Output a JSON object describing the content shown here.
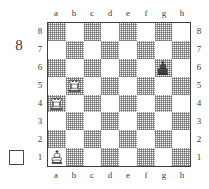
{
  "diagram": {
    "number": "8",
    "side_to_move_marker": "white-empty-square",
    "side_to_move": "white"
  },
  "board": {
    "files": [
      "a",
      "b",
      "c",
      "d",
      "e",
      "f",
      "g",
      "h"
    ],
    "ranks": [
      "8",
      "7",
      "6",
      "5",
      "4",
      "3",
      "2",
      "1"
    ],
    "light_square_color": "#ffffff",
    "dark_square_color": "#9a9a9a",
    "border_color": "#3d3d3d",
    "a1_square_shade": "light",
    "pieces": [
      {
        "square": "g6",
        "piece": "king",
        "color": "black",
        "glyph": "♚"
      },
      {
        "square": "b5",
        "piece": "rook",
        "color": "white",
        "glyph": "♖"
      },
      {
        "square": "a4",
        "piece": "rook",
        "color": "white",
        "glyph": "♖"
      },
      {
        "square": "a1",
        "piece": "king",
        "color": "white",
        "glyph": "♔"
      }
    ]
  }
}
